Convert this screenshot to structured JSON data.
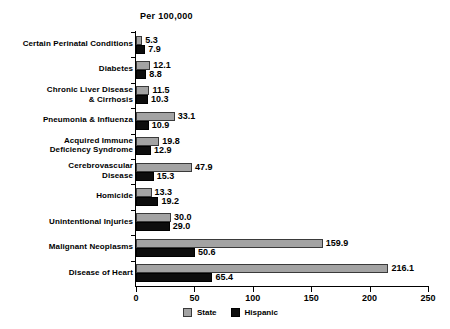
{
  "chart_data": {
    "type": "bar",
    "title": "Per 100,000",
    "orientation": "horizontal",
    "grouped": true,
    "xlabel": "",
    "ylabel": "",
    "xlim": [
      0,
      250
    ],
    "xticks": [
      "0",
      "50",
      "100",
      "150",
      "200",
      "250"
    ],
    "grid": false,
    "legend_position": "bottom",
    "categories": [
      "Certain Perinatal Conditions",
      "Diabetes",
      "Chronic Liver Disease & Cirrhosis",
      "Pneumonia & Influenza",
      "Acquired Immune Deficiency Syndrome",
      "Cerebrovascular Disease",
      "Homicide",
      "Unintentional Injuries",
      "Malignant Neoplasms",
      "Disease of Heart"
    ],
    "category_lines": [
      [
        "Certain Perinatal Conditions"
      ],
      [
        "Diabetes"
      ],
      [
        "Chronic Liver Disease",
        "& Cirrhosis"
      ],
      [
        "Pneumonia & Influenza"
      ],
      [
        "Acquired Immune",
        "Deficiency Syndrome"
      ],
      [
        "Cerebrovascular",
        "Disease"
      ],
      [
        "Homicide"
      ],
      [
        "Unintentional Injuries"
      ],
      [
        "Malignant Neoplasms"
      ],
      [
        "Disease of Heart"
      ]
    ],
    "series": [
      {
        "name": "State",
        "color": "#a3a3a3",
        "values": [
          5.3,
          12.1,
          11.5,
          33.1,
          19.8,
          47.9,
          13.3,
          30.0,
          159.9,
          216.1
        ],
        "labels": [
          "5.3",
          "12.1",
          "11.5",
          "33.1",
          "19.8",
          "47.9",
          "13.3",
          "30.0",
          "159.9",
          "216.1"
        ]
      },
      {
        "name": "Hispanic",
        "color": "#0d0d0d",
        "values": [
          7.9,
          8.8,
          10.3,
          10.9,
          12.9,
          15.3,
          19.2,
          29.0,
          50.6,
          65.4
        ],
        "labels": [
          "7.9",
          "8.8",
          "10.3",
          "10.9",
          "12.9",
          "15.3",
          "19.2",
          "29.0",
          "50.6",
          "65.4"
        ]
      }
    ]
  },
  "legend": {
    "items": [
      {
        "label": "State",
        "color": "#a3a3a3"
      },
      {
        "label": "Hispanic",
        "color": "#0d0d0d"
      }
    ]
  }
}
